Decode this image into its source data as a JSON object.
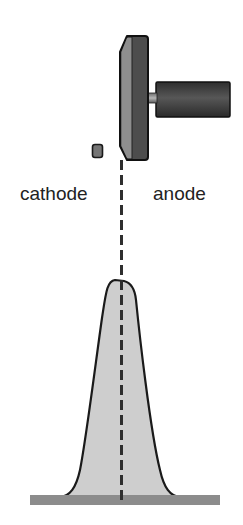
{
  "diagram": {
    "labels": {
      "cathode": "cathode",
      "anode": "anode"
    },
    "components": [
      {
        "name": "cathode",
        "shape": "small-rounded-square",
        "position": "left of axis"
      },
      {
        "name": "anode-plate",
        "shape": "beveled-vertical-plate",
        "position": "right of axis"
      },
      {
        "name": "anode-rod",
        "shape": "short-rod"
      },
      {
        "name": "anode-holder",
        "shape": "horizontal-cylinder"
      },
      {
        "name": "beam-axis",
        "shape": "dashed-vertical-line"
      },
      {
        "name": "intensity-profile",
        "shape": "bell-shaped-peak, flat top skewed"
      },
      {
        "name": "baseline",
        "shape": "horizontal-bar"
      }
    ],
    "colors": {
      "plate_face": "#8a8a8a",
      "plate_body": "#4a4a4a",
      "cylinder": "#3a3a3a",
      "rod": "#9a9a9a",
      "cathode": "#707070",
      "outline": "#1a1a1a",
      "peak_fill": "#cfcfcf",
      "baseline": "#8c8c8c",
      "dash": "#333333"
    }
  }
}
